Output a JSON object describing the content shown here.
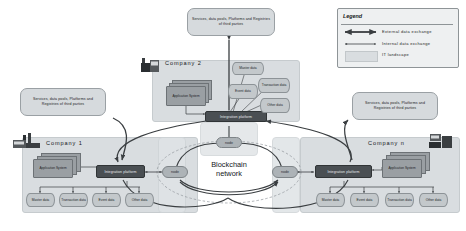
{
  "diagram": {
    "center_label_line1": "Blockchain",
    "center_label_line2": "network",
    "node_label": "node",
    "integration_platform_label": "Integration platform",
    "application_system_label": "Application System",
    "third_party_text": "Services, data pools, Platforms and Registries of third parties",
    "third_party_text_top": "Services,  data pools,  Platforms and  Registries of third parties",
    "third_party_text_left": "Services, data pools, Platforms and Registries of third parties",
    "third_party_text_right": "Services, data pools, Platforms and Registries of third parties"
  },
  "companies": [
    {
      "id": "company-1",
      "name": "Company 1",
      "integration_platform": "Integration platform",
      "application_system": "Application System",
      "data_stores": [
        "Master data",
        "Transaction data",
        "Event data",
        "Other data"
      ]
    },
    {
      "id": "company-2",
      "name": "Company 2",
      "integration_platform": "Integration platform",
      "application_system": "Application System",
      "data_stores": [
        "Master data",
        "Transaction data",
        "Event data",
        "Other data"
      ]
    },
    {
      "id": "company-n",
      "name": "Company  n",
      "integration_platform": "Integration platform",
      "application_system": "Application System",
      "data_stores": [
        "Master data",
        "Event data",
        "Transaction data",
        "Other data"
      ]
    }
  ],
  "legend": {
    "title": "Legend",
    "items": [
      {
        "symbol": "double-arrow-thick",
        "label": "External  data  exchange"
      },
      {
        "symbol": "double-arrow-thin",
        "label": "Internal  data  exchange"
      },
      {
        "symbol": "swatch",
        "label": "IT landscape"
      }
    ]
  },
  "colors": {
    "it_landscape": "#d9dde0",
    "integration_platform": "#4a4f53",
    "node": "#adb3b7",
    "datastore": "#c3c8cb",
    "application_system": "#9a9fa3",
    "arrow": "#3a3e41",
    "legend_bg": "#eef0f1"
  }
}
